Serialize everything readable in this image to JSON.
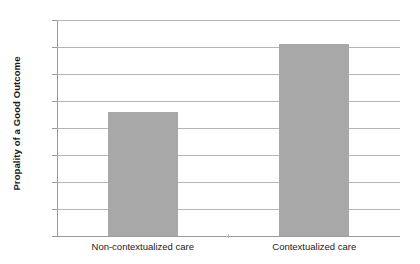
{
  "chart_data": {
    "type": "bar",
    "title": "",
    "xlabel": "",
    "ylabel": "Propality of a Good Outcome",
    "categories": [
      "Non-contextualized care",
      "Contextualized care"
    ],
    "values": [
      46,
      71
    ],
    "value_labels": [
      "46%",
      "71%"
    ],
    "unit": "%",
    "ylim": [
      0,
      80
    ],
    "ytick_step": 10,
    "ytick_labels": [
      "80%",
      "70%",
      "60%",
      "50%",
      "40%",
      "30%",
      "20%",
      "10%",
      "0%"
    ],
    "ytick_values": [
      80,
      70,
      60,
      50,
      40,
      30,
      20,
      10,
      0
    ],
    "grid": "horizontal",
    "legend": "none",
    "series": [
      {
        "name": "Propality of a Good Outcome",
        "values": [
          46,
          71
        ],
        "color": "#a8a8a8"
      }
    ],
    "colors": {
      "bar_fill": "#a8a8a8",
      "gridline": "#b5b5b5",
      "axis_line": "#9a9a9a",
      "text": "#1a1a1a",
      "background": "#ffffff"
    }
  }
}
